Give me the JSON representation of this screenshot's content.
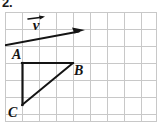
{
  "figure": {
    "problem_number": "2.",
    "width": 158,
    "height": 129,
    "background_color": "#ffffff",
    "ink_color": "#141414"
  },
  "grid": {
    "columns": 9,
    "rows": 7,
    "cell_size": 17,
    "origin_x": 5,
    "origin_y": 12,
    "line_color": "#c8c8c8",
    "line_width": 1
  },
  "vector": {
    "name": "v",
    "label": "v",
    "label_accent": "right-arrow-overbar",
    "start_x": -2,
    "start_y": 33,
    "end_x": 79,
    "end_y": 18,
    "arrowhead": "end",
    "stroke_width": 1.8,
    "color": "#141414"
  },
  "triangle": {
    "name": "ABC",
    "stroke_width": 2,
    "color": "#141414",
    "vertices": [
      {
        "label": "A",
        "x": 17,
        "y": 51,
        "label_dx": -10,
        "label_dy": -15
      },
      {
        "label": "B",
        "x": 68,
        "y": 51,
        "label_dx": 6,
        "label_dy": 1
      },
      {
        "label": "C",
        "x": 17,
        "y": 93,
        "label_dx": -12,
        "label_dy": 1
      }
    ],
    "edges": [
      {
        "from": "A",
        "to": "B",
        "type": "horizontal-leg"
      },
      {
        "from": "A",
        "to": "C",
        "type": "vertical-leg"
      },
      {
        "from": "C",
        "to": "B",
        "type": "hypotenuse"
      }
    ]
  }
}
